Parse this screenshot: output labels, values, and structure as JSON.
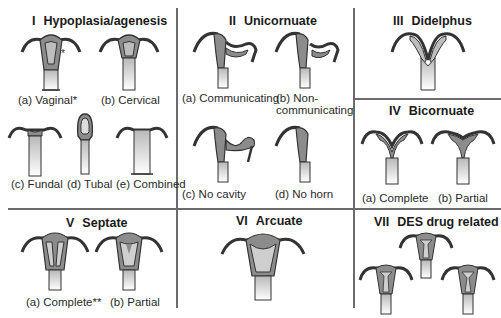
{
  "colors": {
    "outline": "#333333",
    "wall": "#8c8c8c",
    "cavity_dark": "#7a7a7a",
    "canal_top": "#bdbdbd",
    "canal_bottom": "#ffffff",
    "divider": "#6b6b6b"
  },
  "sections": [
    {
      "id": "I",
      "numeral": "I",
      "title": "Hypoplasia/agenesis",
      "items": [
        {
          "label": "(a) Vaginal*"
        },
        {
          "label": "(b) Cervical"
        },
        {
          "label": "(c) Fundal"
        },
        {
          "label": "(d) Tubal"
        },
        {
          "label": "(e) Combined"
        }
      ]
    },
    {
      "id": "II",
      "numeral": "II",
      "title": "Unicornuate",
      "items": [
        {
          "label": "(a) Communicating"
        },
        {
          "label_line1": "(b) Non-",
          "label_line2": "communicating"
        },
        {
          "label": "(c) No cavity"
        },
        {
          "label": "(d) No horn"
        }
      ]
    },
    {
      "id": "III",
      "numeral": "III",
      "title": "Didelphus",
      "items": []
    },
    {
      "id": "IV",
      "numeral": "IV",
      "title": "Bicornuate",
      "items": [
        {
          "label": "(a) Complete"
        },
        {
          "label": "(b) Partial"
        }
      ]
    },
    {
      "id": "V",
      "numeral": "V",
      "title": "Septate",
      "items": [
        {
          "label": "(a) Complete**"
        },
        {
          "label": "(b) Partial"
        }
      ]
    },
    {
      "id": "VI",
      "numeral": "VI",
      "title": "Arcuate",
      "items": []
    },
    {
      "id": "VII",
      "numeral": "VII",
      "title": "DES drug related",
      "items": []
    }
  ],
  "annotations": {
    "asterisk_mark": "*"
  }
}
